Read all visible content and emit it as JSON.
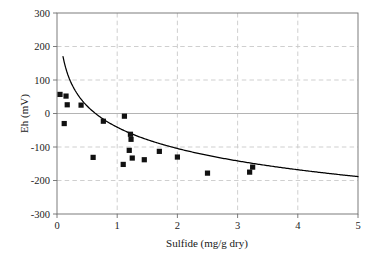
{
  "chart_data": {
    "type": "scatter",
    "title": "",
    "xlabel": "Sulfide (mg/g dry)",
    "ylabel": "Eh (mV)",
    "xlim": [
      0,
      5
    ],
    "ylim": [
      -300,
      300
    ],
    "xticks": [
      0,
      1,
      2,
      3,
      4,
      5
    ],
    "xticklabels": [
      "0",
      "1",
      "2",
      "3",
      "4",
      "5"
    ],
    "yticks": [
      -300,
      -200,
      -100,
      0,
      100,
      200,
      300
    ],
    "yticklabels": [
      "-300",
      "-200",
      "-100",
      "0",
      "100",
      "200",
      "300"
    ],
    "grid": true,
    "grid_style": "dashed",
    "grid_color": "#c9c9c9",
    "zero_line": true,
    "zero_line_color": "#b4b4b4",
    "legend": false,
    "legend_position": "none",
    "marker_shape": "square",
    "marker_color": "#111111",
    "marker_size": 5.2,
    "series": [
      {
        "name": "Eh vs Sulfide",
        "x": [
          0.05,
          0.15,
          0.17,
          0.12,
          0.4,
          0.6,
          0.77,
          1.1,
          1.12,
          1.2,
          1.22,
          1.23,
          1.25,
          1.45,
          1.7,
          2.0,
          2.5,
          3.2,
          3.25
        ],
        "y": [
          57,
          52,
          26,
          -30,
          25,
          -131,
          -23,
          -152,
          -8,
          -110,
          -62,
          -77,
          -133,
          -138,
          -113,
          -130,
          -178,
          -175,
          -160
        ]
      }
    ],
    "fit_curve": {
      "name": "logarithmic fit",
      "equation": "Eh = -41 - 91.5*ln(x)",
      "color": "#000000",
      "x_range": [
        0.1,
        5.0
      ]
    },
    "n_points": 19
  }
}
